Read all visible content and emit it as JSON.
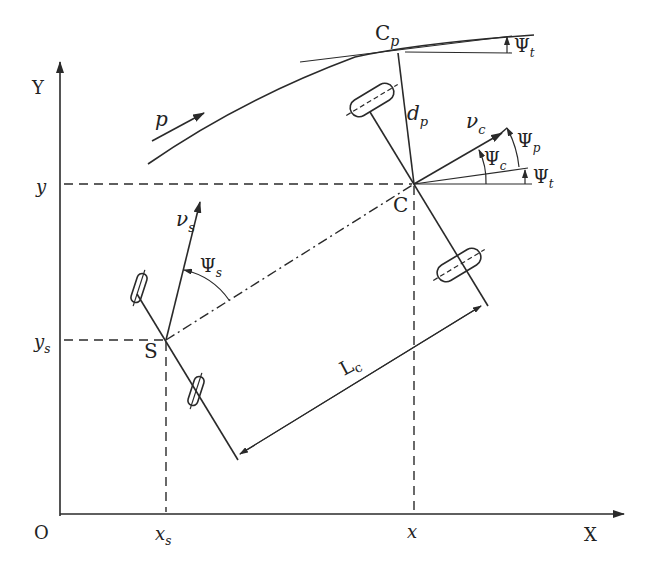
{
  "figure": {
    "colors": {
      "ink": "#2a2a2a",
      "background": "#ffffff"
    }
  },
  "axes": {
    "x_label": "X",
    "y_label": "Y",
    "origin_label": "O",
    "x_ticks": [
      "x_s",
      "x"
    ],
    "y_ticks": [
      "y",
      "y_s"
    ]
  },
  "labels": {
    "path": "p",
    "path_point": "C",
    "path_point_sub": "p",
    "distance": "d",
    "distance_sub": "p",
    "front_point": "C",
    "rear_point": "S",
    "front_velocity": "ν",
    "front_velocity_sub": "c",
    "rear_velocity": "ν",
    "rear_velocity_sub": "s",
    "psi_c": "Ψ",
    "psi_c_sub": "c",
    "psi_p": "Ψ",
    "psi_p_sub": "p",
    "psi_t": "Ψ",
    "psi_t_sub": "t",
    "psi_t_top": "Ψ",
    "psi_t_top_sub": "t",
    "psi_s": "Ψ",
    "psi_s_sub": "s",
    "length": "L",
    "length_sub": "c",
    "x_tick_xs": "x",
    "x_tick_xs_sub": "s",
    "x_tick_x": "x",
    "y_tick_y": "y",
    "y_tick_ys": "y",
    "y_tick_ys_sub": "s"
  }
}
